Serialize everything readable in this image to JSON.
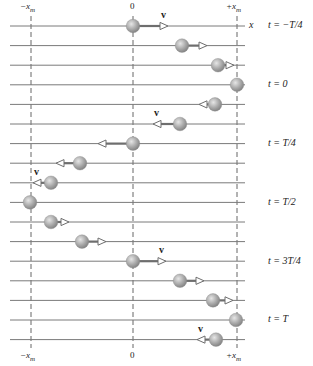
{
  "figure": {
    "axis_variable": "x",
    "vertical_markers": [
      {
        "id": "minus_xm",
        "label": "−x_m",
        "x": 31
      },
      {
        "id": "zero",
        "label": "0",
        "x": 133
      },
      {
        "id": "plus_xm",
        "label": "+x_m",
        "x": 237
      }
    ],
    "top_labels": {
      "minus_xm": "−x",
      "minus_xm_sub": "m",
      "zero": "0",
      "plus_xm": "+x",
      "plus_xm_sub": "m",
      "axis": "x"
    },
    "bottom_labels": {
      "minus_xm": "−x",
      "minus_xm_sub": "m",
      "zero": "0",
      "plus_xm": "+x",
      "plus_xm_sub": "m"
    },
    "velocity_symbol": "v",
    "time_labels": [
      {
        "row": 0,
        "text": "t = −T/4"
      },
      {
        "row": 3,
        "text": "t = 0"
      },
      {
        "row": 6,
        "text": "t = T/4"
      },
      {
        "row": 9,
        "text": "t = T/2"
      },
      {
        "row": 12,
        "text": "t = 3T/4"
      },
      {
        "row": 15,
        "text": "t = T"
      }
    ],
    "rows": [
      {
        "ball_x": 133,
        "arrow_to": 168,
        "v_label": true
      },
      {
        "ball_x": 182,
        "arrow_to": 207,
        "v_label": false
      },
      {
        "ball_x": 218,
        "arrow_to": 234,
        "v_label": false
      },
      {
        "ball_x": 237,
        "arrow_to": null,
        "v_label": false
      },
      {
        "ball_x": 215,
        "arrow_to": 199,
        "v_label": false
      },
      {
        "ball_x": 180,
        "arrow_to": 153,
        "v_label": true
      },
      {
        "ball_x": 133,
        "arrow_to": 98,
        "v_label": false
      },
      {
        "ball_x": 80,
        "arrow_to": 56,
        "v_label": false
      },
      {
        "ball_x": 51,
        "arrow_to": 33,
        "v_label": true
      },
      {
        "ball_x": 30,
        "arrow_to": null,
        "v_label": false
      },
      {
        "ball_x": 51,
        "arrow_to": 69,
        "v_label": false
      },
      {
        "ball_x": 82,
        "arrow_to": 106,
        "v_label": false
      },
      {
        "ball_x": 133,
        "arrow_to": 166,
        "v_label": true
      },
      {
        "ball_x": 180,
        "arrow_to": 204,
        "v_label": false
      },
      {
        "ball_x": 213,
        "arrow_to": 233,
        "v_label": false
      },
      {
        "ball_x": 236,
        "arrow_to": null,
        "v_label": false
      },
      {
        "ball_x": 216,
        "arrow_to": 197,
        "v_label": true
      }
    ],
    "colors": {
      "line": "#7a7a7a",
      "dash": "#555555",
      "ball_light": "#d8d8d8",
      "ball_mid": "#a8a8a8",
      "ball_dark": "#7e7e7e",
      "arrow": "#6e6e6e",
      "text": "#222222"
    }
  }
}
